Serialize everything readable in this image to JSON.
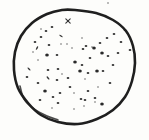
{
  "drawing": {
    "kind": "hand-drawn stippled circle sketch",
    "canvas": {
      "width": 149,
      "height": 140
    },
    "paper_color": "#fdfdfb",
    "ink_color": "#1f1f1f",
    "outline": {
      "stroke_width": 2.6,
      "points": [
        [
          75,
          10
        ],
        [
          96,
          13
        ],
        [
          113,
          20
        ],
        [
          126,
          31
        ],
        [
          133,
          46
        ],
        [
          135,
          63
        ],
        [
          132,
          81
        ],
        [
          125,
          97
        ],
        [
          113,
          110
        ],
        [
          97,
          119
        ],
        [
          78,
          124
        ],
        [
          58,
          122
        ],
        [
          41,
          115
        ],
        [
          28,
          103
        ],
        [
          18,
          88
        ],
        [
          14,
          70
        ],
        [
          15,
          52
        ],
        [
          21,
          36
        ],
        [
          32,
          23
        ],
        [
          47,
          14
        ],
        [
          62,
          10
        ]
      ],
      "retrace_points": [
        [
          20,
          86
        ],
        [
          24,
          99
        ],
        [
          34,
          109
        ],
        [
          47,
          116
        ],
        [
          58,
          120
        ]
      ],
      "retrace_stroke_width": 1.6
    },
    "marks": [
      [
        68,
        21,
        "x",
        0
      ],
      [
        108,
        3,
        "s",
        0
      ],
      [
        52,
        27,
        "d",
        0
      ],
      [
        125,
        30,
        "d",
        0
      ],
      [
        46,
        31,
        "d",
        0
      ],
      [
        114,
        34,
        "d",
        0
      ],
      [
        61,
        36,
        "l",
        35
      ],
      [
        41,
        29,
        "s",
        0
      ],
      [
        41,
        37,
        "d",
        0
      ],
      [
        107,
        38,
        "d",
        0
      ],
      [
        82,
        38,
        "s",
        0
      ],
      [
        35,
        42,
        "d",
        0
      ],
      [
        121,
        42,
        "d",
        0
      ],
      [
        100,
        43,
        "d",
        0
      ],
      [
        61,
        44,
        "s",
        0
      ],
      [
        67,
        44,
        "s",
        0
      ],
      [
        49,
        45,
        "d",
        0
      ],
      [
        86,
        46,
        "d",
        0
      ],
      [
        92,
        47,
        "s",
        0
      ],
      [
        72,
        48,
        "s",
        0
      ],
      [
        37,
        48,
        "l",
        120
      ],
      [
        94,
        48,
        "b",
        0
      ],
      [
        83,
        49,
        "d",
        0
      ],
      [
        130,
        50,
        "d",
        0
      ],
      [
        33,
        52,
        "s",
        0
      ],
      [
        102,
        53,
        "b",
        0
      ],
      [
        118,
        53,
        "d",
        0
      ],
      [
        47,
        55,
        "b",
        0
      ],
      [
        57,
        55,
        "d",
        0
      ],
      [
        108,
        56,
        "d",
        0
      ],
      [
        90,
        58,
        "d",
        0
      ],
      [
        38,
        60,
        "s",
        0
      ],
      [
        75,
        62,
        "b",
        0
      ],
      [
        113,
        65,
        "d",
        0
      ],
      [
        82,
        65,
        "d",
        0
      ],
      [
        29,
        69,
        "l",
        45
      ],
      [
        58,
        69,
        "d",
        0
      ],
      [
        48,
        70,
        "d",
        0
      ],
      [
        97,
        71,
        "b",
        0
      ],
      [
        80,
        71,
        "b",
        0
      ],
      [
        103,
        71,
        "d",
        0
      ],
      [
        88,
        73,
        "d",
        0
      ],
      [
        62,
        74,
        "s",
        0
      ],
      [
        27,
        77,
        "d",
        0
      ],
      [
        68,
        78,
        "d",
        0
      ],
      [
        48,
        78,
        "l",
        50
      ],
      [
        57,
        80,
        "d",
        0
      ],
      [
        85,
        79,
        "s",
        0
      ],
      [
        38,
        83,
        "d",
        0
      ],
      [
        110,
        83,
        "d",
        0
      ],
      [
        70,
        87,
        "d",
        0
      ],
      [
        98,
        87,
        "s",
        0
      ],
      [
        45,
        91,
        "b",
        0
      ],
      [
        88,
        91,
        "d",
        0
      ],
      [
        74,
        93,
        "s",
        0
      ],
      [
        60,
        93,
        "d",
        0
      ],
      [
        53,
        97,
        "d",
        0
      ],
      [
        81,
        99,
        "d",
        0
      ],
      [
        95,
        98,
        "d",
        0
      ],
      [
        40,
        100,
        "d",
        0
      ],
      [
        85,
        100,
        "d",
        0
      ],
      [
        95,
        102,
        "s",
        0
      ],
      [
        102,
        104,
        "b",
        0
      ],
      [
        58,
        103,
        "d",
        0
      ],
      [
        84,
        106,
        "s",
        0
      ],
      [
        52,
        108,
        "s",
        0
      ],
      [
        74,
        109,
        "s",
        0
      ]
    ],
    "mark_styles": {
      "d": {
        "rx": 1.35,
        "ry": 1.1,
        "opacity": 0.92
      },
      "s": {
        "rx": 0.95,
        "ry": 0.8,
        "opacity": 0.6
      },
      "b": {
        "rx": 1.8,
        "ry": 1.5,
        "opacity": 0.95
      },
      "l": {
        "rx": 2.0,
        "ry": 0.75,
        "opacity": 0.9
      },
      "x": {
        "len": 4.4,
        "stroke_width": 1.1,
        "opacity": 0.9
      }
    }
  }
}
